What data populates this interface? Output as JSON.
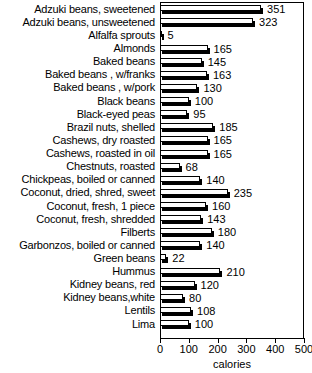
{
  "chart_data": {
    "type": "bar",
    "orientation": "horizontal",
    "title": "",
    "xlabel": "calories",
    "ylabel": "",
    "xlim": [
      0,
      500
    ],
    "xticks": [
      0,
      100,
      200,
      300,
      400,
      500
    ],
    "grid": false,
    "legend": null,
    "categories": [
      "Adzuki beans, sweetened",
      "Adzuki beans, unsweetened",
      "Alfalfa sprouts",
      "Almonds",
      "Baked beans",
      "Baked beans , w/franks",
      "Baked beans , w/pork",
      "Black beans",
      "Black-eyed peas",
      "Brazil nuts, shelled",
      "Cashews, dry roasted",
      "Cashews, roasted in oil",
      "Chestnuts, roasted",
      "Chickpeas, boiled or canned",
      "Coconut, dried, shred, sweet",
      "Coconut, fresh, 1 piece",
      "Coconut, fresh, shredded",
      "Filberts",
      "Garbonzos, boiled or canned",
      "Green beans",
      "Hummus",
      "Kidney beans, red",
      "Kidney beans,white",
      "Lentils",
      "Lima"
    ],
    "values": [
      351,
      323,
      5,
      165,
      145,
      163,
      130,
      100,
      95,
      185,
      165,
      165,
      68,
      140,
      235,
      160,
      143,
      180,
      140,
      22,
      210,
      120,
      80,
      108,
      100
    ],
    "value_labels": [
      "351",
      "323",
      "5",
      "165",
      "145",
      "163",
      "130",
      "100",
      "95",
      "185",
      "165",
      "165",
      "68",
      "140",
      "235",
      "160",
      "143",
      "180",
      "140",
      "22",
      "210",
      "120",
      "80",
      "108",
      "100"
    ],
    "xtick_labels": [
      "0",
      "100",
      "200",
      "300",
      "400",
      "500"
    ]
  }
}
